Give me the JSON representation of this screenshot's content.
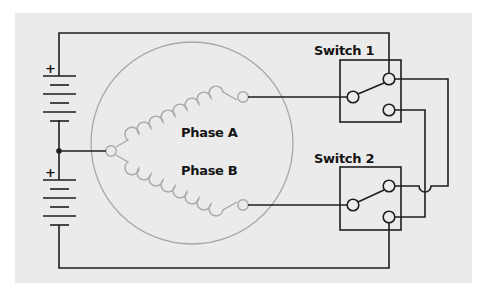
{
  "diagram": {
    "type": "bipolar-stepper-motor-wiring",
    "colors": {
      "background": "#ffffff",
      "panel": "#ebebeb",
      "wire": "#1e1e1e",
      "motor": "#a8a8a8"
    },
    "batteries": [
      {
        "id": "battery-1",
        "polarity_label": "+"
      },
      {
        "id": "battery-2",
        "polarity_label": "+"
      }
    ],
    "motor": {
      "phases": [
        {
          "id": "phase-a",
          "label": "Phase A"
        },
        {
          "id": "phase-b",
          "label": "Phase B"
        }
      ]
    },
    "switches": [
      {
        "id": "switch-1",
        "label": "Switch 1"
      },
      {
        "id": "switch-2",
        "label": "Switch 2"
      }
    ]
  }
}
